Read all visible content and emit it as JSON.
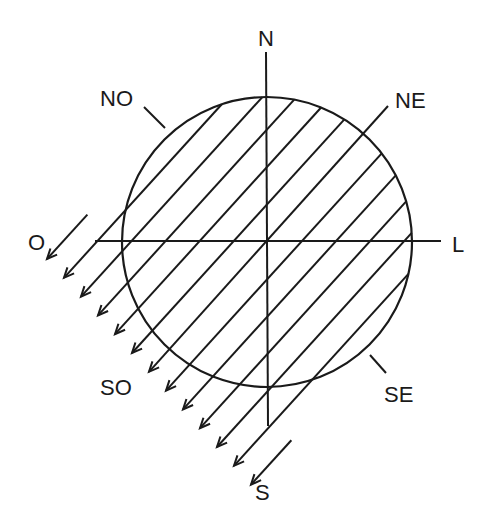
{
  "labels": {
    "north": "N",
    "northeast": "NE",
    "east": "L",
    "southeast": "SE",
    "south": "S",
    "southwest": "SO",
    "west": "O",
    "northwest": "NO"
  },
  "colors": {
    "stroke": "#1a1a1a",
    "background": "#ffffff"
  },
  "geometry": {
    "circle": {
      "cx": 267,
      "cy": 242,
      "r": 145
    },
    "ray_count": 13,
    "ray_direction": "NE to SW",
    "first_arrow_tip": [
      47,
      259
    ],
    "arrow_tip_step": [
      17,
      18.8
    ],
    "ne_ray_index": 6,
    "ne_ray_outer_end": [
      388,
      106
    ]
  }
}
